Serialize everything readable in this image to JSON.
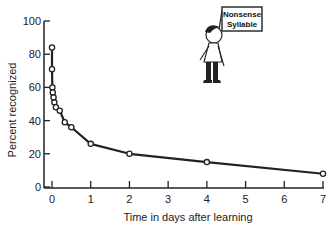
{
  "chart_data": {
    "type": "line",
    "title": "",
    "xlabel": "Time in days after learning",
    "ylabel": "Percent recognized",
    "xlim": [
      0,
      7
    ],
    "ylim": [
      0,
      100
    ],
    "x_ticks": [
      "0",
      "1",
      "2",
      "3",
      "4",
      "5",
      "6",
      "7"
    ],
    "y_ticks": [
      "0",
      "20",
      "40",
      "60",
      "80",
      "100"
    ],
    "grid": false,
    "legend": null,
    "series": [
      {
        "name": "Retention curve",
        "x": [
          0,
          0,
          0.01,
          0.02,
          0.04,
          0.06,
          0.1,
          0.2,
          0.33,
          0.5,
          1,
          2,
          4,
          7
        ],
        "values": [
          84,
          71,
          60,
          57,
          54,
          51,
          48,
          46,
          39,
          36,
          26,
          20,
          15,
          8
        ]
      }
    ],
    "annotation": {
      "type": "cartoon",
      "description": "boy holding sign",
      "sign_text_line1": "Nonsense",
      "sign_text_line2": "Syllable"
    }
  },
  "colors": {
    "line": "#222222",
    "marker_fill": "#ffffff",
    "axis": "#222222"
  }
}
